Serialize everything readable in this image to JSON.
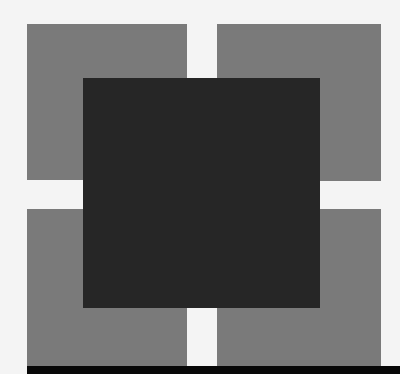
{
  "figure": {
    "colors": {
      "background": "#f4f4f4",
      "outer_squares": "#7a7a7a",
      "center_square": "#262626",
      "bottom_bar": "#080808"
    },
    "shapes": [
      {
        "name": "top-left-square",
        "x": 27,
        "y": 24,
        "w": 160,
        "h": 156
      },
      {
        "name": "top-right-square",
        "x": 217,
        "y": 24,
        "w": 164,
        "h": 157
      },
      {
        "name": "bottom-left-square",
        "x": 27,
        "y": 209,
        "w": 160,
        "h": 157
      },
      {
        "name": "bottom-right-square",
        "x": 217,
        "y": 209,
        "w": 164,
        "h": 157
      },
      {
        "name": "center-square",
        "x": 83,
        "y": 78,
        "w": 237,
        "h": 230
      },
      {
        "name": "bottom-bar",
        "x": 27,
        "y": 366,
        "w": 373,
        "h": 8
      }
    ]
  }
}
